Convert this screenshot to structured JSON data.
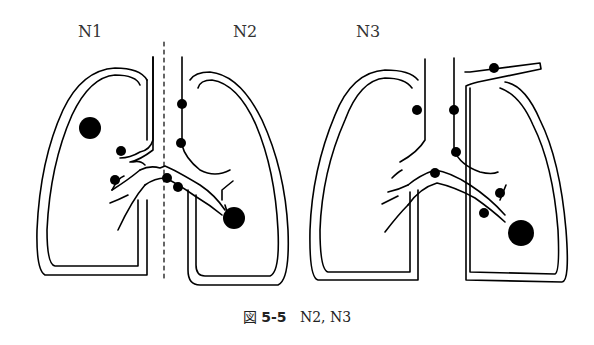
{
  "labels": {
    "n1": "N1",
    "n2": "N2",
    "n3": "N3"
  },
  "caption": {
    "prefix": "図",
    "number": "5-5",
    "text": "N2, N3"
  }
}
